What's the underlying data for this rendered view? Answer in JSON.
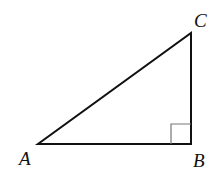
{
  "diagram": {
    "type": "right-triangle",
    "vertices": {
      "A": {
        "label": "A",
        "x": 38,
        "y": 144
      },
      "B": {
        "label": "B",
        "x": 191,
        "y": 144
      },
      "C": {
        "label": "C",
        "x": 191,
        "y": 33
      }
    },
    "right_angle_at": "B",
    "colors": {
      "stroke": "#111111",
      "marker": "#777777",
      "background": "#ffffff"
    }
  }
}
